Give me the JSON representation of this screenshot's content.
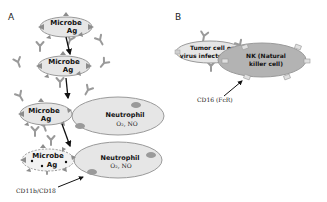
{
  "panels": {
    "a": {
      "label": "A",
      "microbe_1": {
        "line1": "Microbe",
        "line2": "Ag"
      },
      "microbe_2": {
        "line1": "Microbe",
        "line2": "Ag"
      },
      "microbe_3": {
        "line1": "Microbe",
        "line2": "Ag"
      },
      "microbe_4": {
        "line1": "Microbe",
        "line2": "Ag"
      },
      "neutrophil_1": {
        "name": "Neutrophil",
        "products": "O₂, NO"
      },
      "neutrophil_2": {
        "name": "Neutrophil",
        "products": "O₂, NO"
      },
      "receptor_caption": "CD11b/CD18"
    },
    "b": {
      "label": "B",
      "target_cell": {
        "line1": "Tumor cell or",
        "line2": "virus infected cell"
      },
      "nk_cell": {
        "line1": "NK (Natural",
        "line2": "killer cell)"
      },
      "receptor_caption": "CD16 (FcR)"
    }
  },
  "colors": {
    "cell_fill": "#e6e6e6",
    "nk_fill": "#b3b3b3",
    "receptor_fill": "#9a9a9a",
    "antigen_fill": "#8c8c8c",
    "antibody": "#9a9a9a",
    "outline": "#9a9a9a"
  }
}
